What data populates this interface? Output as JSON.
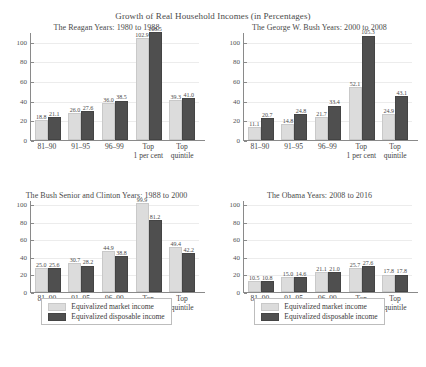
{
  "figure": {
    "title": "Growth of Real Household Incomes (in Percentages)"
  },
  "legend": {
    "market_label": "Equivalized market income",
    "disposable_label": "Equivalized disposable income",
    "market_color": "#dcdcdc",
    "disposable_color": "#4f4f4f"
  },
  "chart_data": [
    {
      "type": "bar",
      "title": "The Reagan Years: 1980 to 1988",
      "xlabel": "",
      "ylabel": "",
      "ylim": [
        0,
        110
      ],
      "yticks": [
        0,
        20,
        40,
        60,
        80,
        100
      ],
      "grid": true,
      "legend_position": "below-figure",
      "categories": [
        "81–90",
        "91–95",
        "96–99",
        "Top 1 per cent",
        "Top quintile"
      ],
      "series": [
        {
          "name": "Equivalized market income",
          "values": [
            18.8,
            26.0,
            36.0,
            102.9,
            39.3
          ]
        },
        {
          "name": "Equivalized disposable income",
          "values": [
            21.1,
            27.6,
            38.5,
            108.5,
            41.0
          ]
        }
      ]
    },
    {
      "type": "bar",
      "title": "The George W. Bush Years: 2000 to 2008",
      "xlabel": "",
      "ylabel": "",
      "ylim": [
        0,
        110
      ],
      "yticks": [
        0,
        20,
        40,
        60,
        80,
        100
      ],
      "grid": true,
      "legend_position": "below-figure",
      "categories": [
        "81–90",
        "91–95",
        "96–99",
        "Top 1 per cent",
        "Top quintile"
      ],
      "series": [
        {
          "name": "Equivalized market income",
          "values": [
            11.1,
            14.8,
            21.7,
            52.1,
            24.9
          ]
        },
        {
          "name": "Equivalized disposable income",
          "values": [
            20.7,
            24.8,
            33.4,
            105.3,
            43.1
          ]
        }
      ]
    },
    {
      "type": "bar",
      "title": "The Bush Senior and Clinton Years: 1988 to 2000",
      "xlabel": "",
      "ylabel": "",
      "ylim": [
        0,
        105
      ],
      "yticks": [
        0,
        20,
        40,
        60,
        80,
        100
      ],
      "grid": true,
      "legend_position": "below-panel",
      "categories": [
        "81–90",
        "91–95",
        "96–99",
        "Top 1 per cent",
        "Top quintile"
      ],
      "series": [
        {
          "name": "Equivalized market income",
          "values": [
            25.0,
            30.7,
            44.9,
            99.9,
            49.4
          ]
        },
        {
          "name": "Equivalized disposable income",
          "values": [
            25.6,
            28.2,
            38.8,
            81.2,
            42.2
          ]
        }
      ]
    },
    {
      "type": "bar",
      "title": "The Obama Years: 2008 to 2016",
      "xlabel": "",
      "ylabel": "",
      "ylim": [
        0,
        105
      ],
      "yticks": [
        0,
        20,
        40,
        60,
        80,
        100
      ],
      "grid": true,
      "legend_position": "below-panel",
      "categories": [
        "81–90",
        "91–95",
        "96–99",
        "Top 1 per cent",
        "Top quintile"
      ],
      "series": [
        {
          "name": "Equivalized market income",
          "values": [
            10.5,
            15.0,
            21.1,
            25.7,
            17.8
          ]
        },
        {
          "name": "Equivalized disposable income",
          "values": [
            10.8,
            14.6,
            21.0,
            27.6,
            17.8
          ]
        }
      ]
    }
  ]
}
